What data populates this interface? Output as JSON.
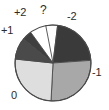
{
  "figure": {
    "background": "#ffffff",
    "outline_color": "#4a4a4a"
  },
  "chart_data": {
    "type": "pie",
    "title": "",
    "xlabel": "",
    "ylabel": "",
    "grid": false,
    "legend_position": "none",
    "labels_on_slices": false,
    "label_placement": "outside",
    "start_angle_deg": 97,
    "direction": "clockwise",
    "categories": [
      "?",
      "-2",
      "-1",
      "0",
      "+1",
      "+2"
    ],
    "values": [
      5,
      22,
      27,
      33,
      9,
      4
    ],
    "units": "percent",
    "slices": [
      {
        "label": "?",
        "value": 5,
        "color": "#fdfdfd",
        "start_angle_deg": 83,
        "end_angle_deg": 101,
        "label_x": 40,
        "label_y": 4
      },
      {
        "label": "-2",
        "value": 22,
        "color": "#3a3a3a",
        "start_angle_deg": 4,
        "end_angle_deg": 83,
        "label_x": 67,
        "label_y": 11
      },
      {
        "label": "-1",
        "value": 27,
        "color": "#a8a8a8",
        "start_angle_deg": -93,
        "end_angle_deg": 4,
        "label_x": 92,
        "label_y": 67
      },
      {
        "label": "0",
        "value": 33,
        "color": "#dedede",
        "start_angle_deg": 174,
        "end_angle_deg": 267,
        "label_x": 11,
        "label_y": 90
      },
      {
        "label": "+1",
        "value": 9,
        "color": "#4a4a4a",
        "start_angle_deg": 141,
        "end_angle_deg": 174,
        "label_x": 1,
        "label_y": 25
      },
      {
        "label": "+2",
        "value": 4,
        "color": "#3f3f3f",
        "start_angle_deg": 126,
        "end_angle_deg": 141,
        "label_x": 14,
        "label_y": 7
      }
    ],
    "geometry": {
      "center_x": 53,
      "center_y": 63,
      "radius": 38
    }
  }
}
